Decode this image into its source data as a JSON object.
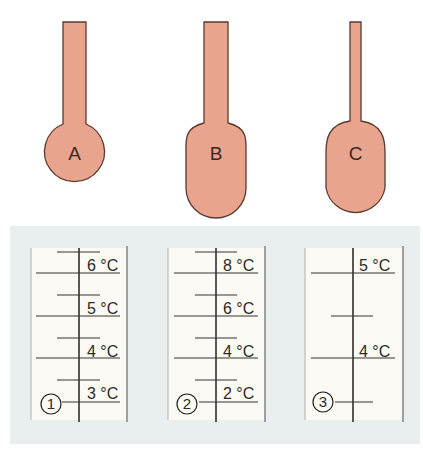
{
  "colors": {
    "bulb_fill": "#e8a48c",
    "bulb_stroke": "#5a3a30",
    "panel_bg": "#e9eeee",
    "scale_bg": "#fbfaf4",
    "line": "#222222",
    "border": "#9a9a9a"
  },
  "thermometers": [
    {
      "label": "A",
      "bulb": "round, small"
    },
    {
      "label": "B",
      "bulb": "elongated, large"
    },
    {
      "label": "C",
      "bulb": "elongated, narrow stem"
    }
  ],
  "scales": [
    {
      "number": "1",
      "labels": [
        "6 °C",
        "5 °C",
        "4 °C",
        "3 °C"
      ]
    },
    {
      "number": "2",
      "labels": [
        "8 °C",
        "6 °C",
        "4 °C",
        "2 °C"
      ]
    },
    {
      "number": "3",
      "labels": [
        "5 °C",
        "4 °C"
      ]
    }
  ]
}
